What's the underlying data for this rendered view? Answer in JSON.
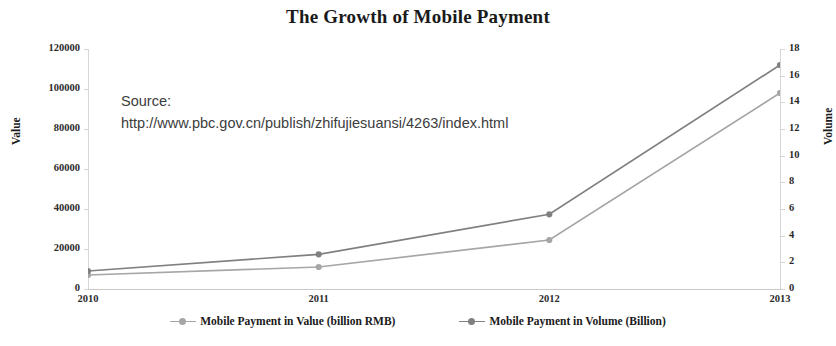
{
  "chart_data": {
    "type": "line",
    "title": "The Growth of Mobile Payment",
    "xlabel": "",
    "ylabel": "Value",
    "y2label": "Volume",
    "categories": [
      "2010",
      "2011",
      "2012",
      "2013"
    ],
    "x": [
      2010,
      2011,
      2012,
      2013
    ],
    "ylim": [
      0,
      120000
    ],
    "y2lim": [
      0,
      18
    ],
    "yticks": [
      "0",
      "20000",
      "40000",
      "60000",
      "80000",
      "100000",
      "120000"
    ],
    "ytick_values": [
      0,
      20000,
      40000,
      60000,
      80000,
      100000,
      120000
    ],
    "y2ticks": [
      "0",
      "2",
      "4",
      "6",
      "8",
      "10",
      "12",
      "14",
      "16",
      "18"
    ],
    "y2tick_values": [
      0,
      2,
      4,
      6,
      8,
      10,
      12,
      14,
      16,
      18
    ],
    "grid": false,
    "legend_position": "bottom",
    "series": [
      {
        "name": "Mobile Payment in Value (billion RMB)",
        "axis": "left",
        "color": "#a6a6a6",
        "marker": "circle",
        "values": [
          7000,
          11000,
          24500,
          98000
        ]
      },
      {
        "name": "Mobile Payment in Volume (Billion)",
        "axis": "right",
        "color": "#808080",
        "marker": "circle",
        "values": [
          1.35,
          2.6,
          5.6,
          16.8
        ]
      }
    ],
    "annotations": [
      {
        "name": "source-note",
        "line1": "Source:",
        "line2": "http://www.pbc.gov.cn/publish/zhifujiesuansi/4263/index.html"
      }
    ]
  },
  "legend": {
    "entries": [
      {
        "label": "Mobile Payment in Value (billion RMB)",
        "color": "#a6a6a6"
      },
      {
        "label": "Mobile Payment in Volume (Billion)",
        "color": "#808080"
      }
    ]
  },
  "colors": {
    "value_series": "#a6a6a6",
    "volume_series": "#808080",
    "axis": "#d6d6d6",
    "text": "#1a1a1a",
    "background": "#ffffff"
  }
}
